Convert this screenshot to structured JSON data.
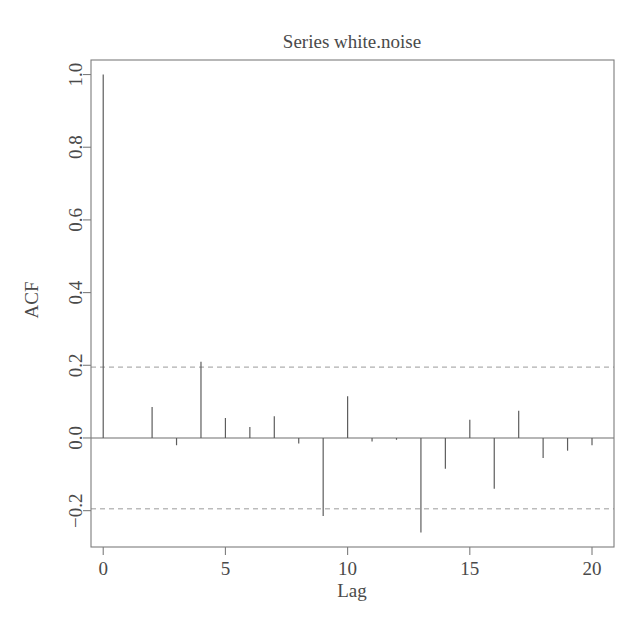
{
  "chart_data": {
    "type": "bar",
    "title": "Series  white.noise",
    "xlabel": "Lag",
    "ylabel": "ACF",
    "xlim": [
      -0.5,
      20.9
    ],
    "ylim": [
      -0.3,
      1.04
    ],
    "xticks": [
      0,
      5,
      10,
      15,
      20
    ],
    "xtick_labels": [
      "0",
      "5",
      "10",
      "15",
      "20"
    ],
    "yticks": [
      -0.2,
      0.0,
      0.2,
      0.4,
      0.6,
      0.8,
      1.0
    ],
    "ytick_labels": [
      "-0.2",
      "0.0",
      "0.2",
      "0.4",
      "0.6",
      "0.8",
      "1.0"
    ],
    "grid": false,
    "legend": "none",
    "confidence_bounds": [
      0.195,
      -0.195
    ],
    "confidence_style": "dashed",
    "x": [
      0,
      1,
      2,
      3,
      4,
      5,
      6,
      7,
      8,
      9,
      10,
      11,
      12,
      13,
      14,
      15,
      16,
      17,
      18,
      19,
      20
    ],
    "values": [
      1.0,
      0.0,
      0.085,
      -0.02,
      0.21,
      0.055,
      0.03,
      0.06,
      -0.015,
      -0.215,
      0.115,
      -0.01,
      -0.005,
      -0.26,
      -0.085,
      0.05,
      -0.14,
      0.075,
      -0.055,
      -0.035,
      -0.02
    ]
  },
  "axis": {
    "y_title": "ACF",
    "x_title": "Lag"
  },
  "title": {
    "text": "Series  white.noise"
  }
}
